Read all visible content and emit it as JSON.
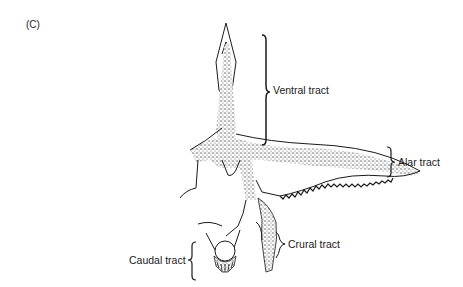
{
  "figure": {
    "panel_label": "(C)",
    "labels": {
      "ventral": "Ventral tract",
      "alar": "Alar tract",
      "crural": "Crural tract",
      "caudal": "Caudal tract"
    },
    "colors": {
      "ink": "#1a1a1a",
      "stipple": "#555555",
      "background": "#ffffff"
    }
  }
}
